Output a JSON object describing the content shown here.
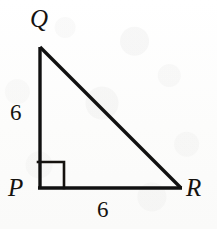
{
  "figure": {
    "kind": "right-triangle-geometry-diagram",
    "background_color": "#fdfdfc",
    "stroke_color": "#111111",
    "vertices": {
      "Q": {
        "label": "Q",
        "x": 40,
        "y": 47
      },
      "P": {
        "label": "P",
        "x": 40,
        "y": 188
      },
      "R": {
        "label": "R",
        "x": 181,
        "y": 188
      }
    },
    "right_angle": {
      "at_vertex": "P",
      "marker": "square",
      "size_px": 26
    },
    "side_labels": {
      "leg_vertical": "6",
      "leg_horizontal": "6"
    },
    "segments": [
      {
        "name": "QP",
        "from": "Q",
        "to": "P"
      },
      {
        "name": "PR",
        "from": "P",
        "to": "R"
      },
      {
        "name": "QR",
        "from": "Q",
        "to": "R"
      }
    ]
  }
}
